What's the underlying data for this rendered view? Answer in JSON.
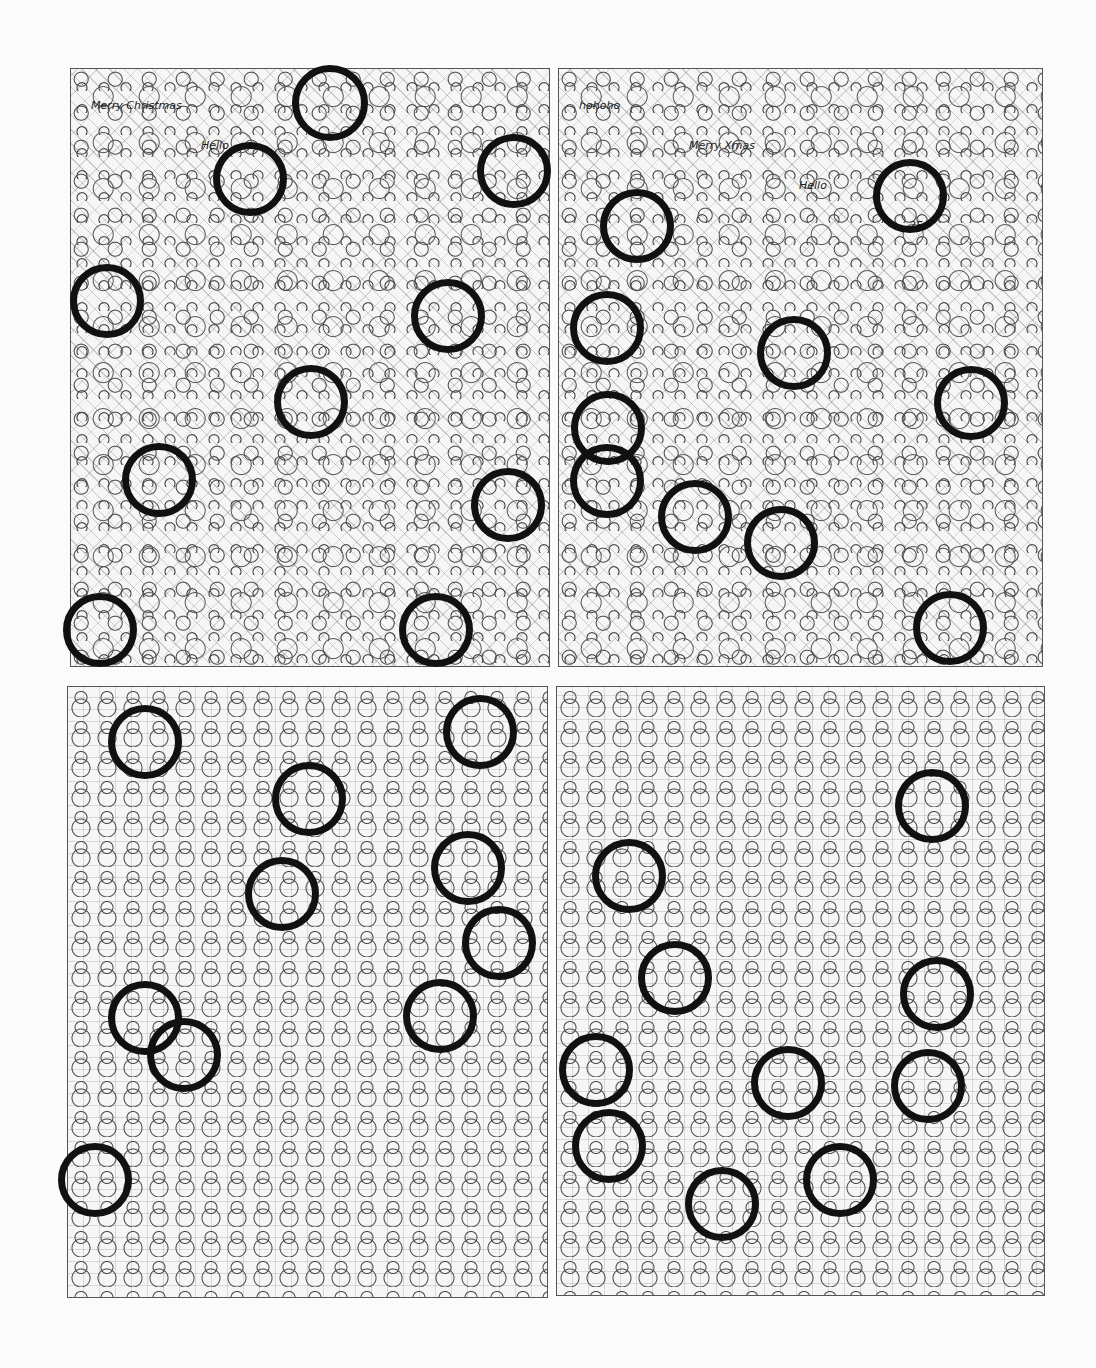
{
  "page": {
    "type": "hidden-object puzzle answer key",
    "background": "#fbfbfb",
    "ring_color": "#111111"
  },
  "panels": [
    {
      "id": "top-left",
      "theme": "christmas doodles",
      "box": {
        "x": 70,
        "y": 68,
        "w": 480,
        "h": 599
      },
      "doodle_text": [
        "Merry Christmas",
        "Hello"
      ],
      "circles": [
        {
          "cx": 330,
          "cy": 103,
          "r": 38
        },
        {
          "cx": 250,
          "cy": 179,
          "r": 37
        },
        {
          "cx": 514,
          "cy": 171,
          "r": 37
        },
        {
          "cx": 107,
          "cy": 301,
          "r": 37
        },
        {
          "cx": 448,
          "cy": 316,
          "r": 37
        },
        {
          "cx": 311,
          "cy": 402,
          "r": 37
        },
        {
          "cx": 159,
          "cy": 480,
          "r": 37
        },
        {
          "cx": 508,
          "cy": 505,
          "r": 37
        },
        {
          "cx": 100,
          "cy": 630,
          "r": 37
        },
        {
          "cx": 436,
          "cy": 630,
          "r": 37
        }
      ]
    },
    {
      "id": "top-right",
      "theme": "christmas doodles",
      "box": {
        "x": 558,
        "y": 68,
        "w": 485,
        "h": 599
      },
      "doodle_text": [
        "hohoho",
        "Merry Xmas",
        "Hello",
        "25"
      ],
      "circles": [
        {
          "cx": 637,
          "cy": 226,
          "r": 37
        },
        {
          "cx": 910,
          "cy": 196,
          "r": 37
        },
        {
          "cx": 607,
          "cy": 328,
          "r": 37
        },
        {
          "cx": 794,
          "cy": 353,
          "r": 37
        },
        {
          "cx": 971,
          "cy": 403,
          "r": 37
        },
        {
          "cx": 608,
          "cy": 428,
          "r": 37
        },
        {
          "cx": 607,
          "cy": 481,
          "r": 37
        },
        {
          "cx": 695,
          "cy": 517,
          "r": 37
        },
        {
          "cx": 781,
          "cy": 543,
          "r": 37
        },
        {
          "cx": 950,
          "cy": 628,
          "r": 37
        }
      ]
    },
    {
      "id": "bottom-left",
      "theme": "snowman crowd",
      "box": {
        "x": 67,
        "y": 686,
        "w": 481,
        "h": 612
      },
      "circles": [
        {
          "cx": 145,
          "cy": 742,
          "r": 37
        },
        {
          "cx": 480,
          "cy": 732,
          "r": 37
        },
        {
          "cx": 309,
          "cy": 799,
          "r": 37
        },
        {
          "cx": 468,
          "cy": 868,
          "r": 37
        },
        {
          "cx": 282,
          "cy": 894,
          "r": 37
        },
        {
          "cx": 499,
          "cy": 943,
          "r": 37
        },
        {
          "cx": 145,
          "cy": 1018,
          "r": 37
        },
        {
          "cx": 440,
          "cy": 1016,
          "r": 37
        },
        {
          "cx": 184,
          "cy": 1055,
          "r": 37
        },
        {
          "cx": 95,
          "cy": 1180,
          "r": 37
        }
      ]
    },
    {
      "id": "bottom-right",
      "theme": "snowman crowd",
      "box": {
        "x": 556,
        "y": 686,
        "w": 489,
        "h": 610
      },
      "circles": [
        {
          "cx": 932,
          "cy": 806,
          "r": 37
        },
        {
          "cx": 629,
          "cy": 876,
          "r": 37
        },
        {
          "cx": 675,
          "cy": 978,
          "r": 37
        },
        {
          "cx": 937,
          "cy": 994,
          "r": 37
        },
        {
          "cx": 596,
          "cy": 1070,
          "r": 37
        },
        {
          "cx": 788,
          "cy": 1083,
          "r": 37
        },
        {
          "cx": 928,
          "cy": 1086,
          "r": 37
        },
        {
          "cx": 609,
          "cy": 1146,
          "r": 37
        },
        {
          "cx": 840,
          "cy": 1180,
          "r": 37
        },
        {
          "cx": 722,
          "cy": 1204,
          "r": 37
        }
      ]
    }
  ]
}
